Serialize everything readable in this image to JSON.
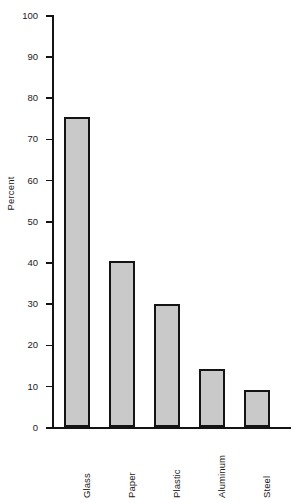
{
  "chart_data": {
    "type": "bar",
    "title": "",
    "subtitle": "",
    "xlabel": "",
    "ylabel": "Percent",
    "categories": [
      "Glass",
      "Paper",
      "Plastic",
      "Aluminum",
      "Steel"
    ],
    "values": [
      75.2,
      40.4,
      29.8,
      14.2,
      8.9
    ],
    "series": [
      {
        "name": "Percent",
        "values": [
          75.2,
          40.4,
          29.8,
          14.2,
          8.9
        ]
      }
    ],
    "ylim": [
      0,
      100
    ],
    "ytick_labels": [
      "0",
      "10",
      "20",
      "30",
      "40",
      "50",
      "60",
      "70",
      "80",
      "90",
      "100"
    ],
    "ytick_values": [
      0,
      10,
      20,
      30,
      40,
      50,
      60,
      70,
      80,
      90,
      100
    ],
    "grid": false,
    "legend": false,
    "legend_position": "none",
    "annotations": [],
    "bar_fill_color": "#c9c9c9",
    "bar_edge_color": "#141414",
    "axis_color": "#131313",
    "background_color": "#ffffff",
    "xtick_label_rotation": 90
  }
}
